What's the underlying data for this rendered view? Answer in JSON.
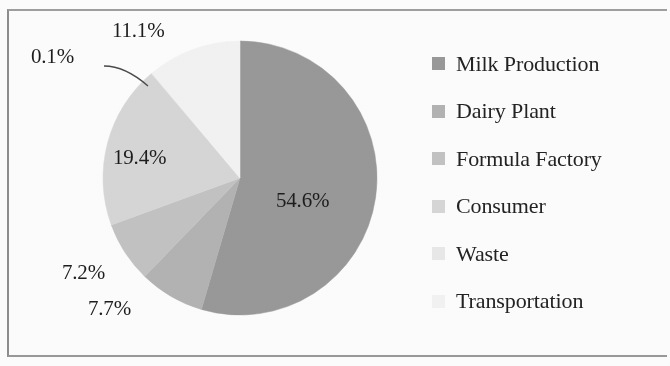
{
  "chart_data": {
    "type": "pie",
    "title": "",
    "subtitle": "",
    "xlabel": "",
    "ylabel": "",
    "grid": false,
    "legend_position": "right",
    "start_angle_deg": 0,
    "direction": "clockwise",
    "categories": [
      "Milk Production",
      "Dairy Plant",
      "Formula Factory",
      "Consumer",
      "Waste",
      "Transportation"
    ],
    "values": [
      54.6,
      7.7,
      7.2,
      19.4,
      0.1,
      11.1
    ],
    "value_unit": "%",
    "data_labels": [
      "54.6%",
      "7.7%",
      "7.2%",
      "19.4%",
      "0.1%",
      "11.1%"
    ],
    "colors": [
      "#9a9a9a",
      "#b4b4b4",
      "#c4c4c4",
      "#d8d8d8",
      "#eaeaea",
      "#f4f4f4"
    ],
    "slices": [
      {
        "label": "Milk Production",
        "value": 54.6,
        "data_label": "54.6%",
        "color": "#9a9a9a",
        "label_placement": "inside"
      },
      {
        "label": "Dairy Plant",
        "value": 7.7,
        "data_label": "7.7%",
        "color": "#b4b4b4",
        "label_placement": "outside"
      },
      {
        "label": "Formula Factory",
        "value": 7.2,
        "data_label": "7.2%",
        "color": "#c4c4c4",
        "label_placement": "outside"
      },
      {
        "label": "Consumer",
        "value": 19.4,
        "data_label": "19.4%",
        "color": "#d8d8d8",
        "label_placement": "inside"
      },
      {
        "label": "Waste",
        "value": 0.1,
        "data_label": "0.1%",
        "color": "#eaeaea",
        "label_placement": "outside-leader"
      },
      {
        "label": "Transportation",
        "value": 11.1,
        "data_label": "11.1%",
        "color": "#f4f4f4",
        "label_placement": "outside"
      }
    ]
  },
  "labels": {
    "milk_production": "54.6%",
    "dairy_plant": "7.7%",
    "formula_factory": "7.2%",
    "consumer": "19.4%",
    "waste": "0.1%",
    "transportation": "11.1%"
  },
  "legend": {
    "items": [
      {
        "label": "Milk Production",
        "color": "#9a9a9a"
      },
      {
        "label": "Dairy Plant",
        "color": "#b4b4b4"
      },
      {
        "label": "Formula Factory",
        "color": "#c4c4c4"
      },
      {
        "label": "Consumer",
        "color": "#d8d8d8"
      },
      {
        "label": "Waste",
        "color": "#eaeaea"
      },
      {
        "label": "Transportation",
        "color": "#f4f4f4"
      }
    ]
  },
  "colors": {
    "border": "#9a9a9a",
    "text": "#1d1d1d",
    "background": "#fefefe"
  }
}
